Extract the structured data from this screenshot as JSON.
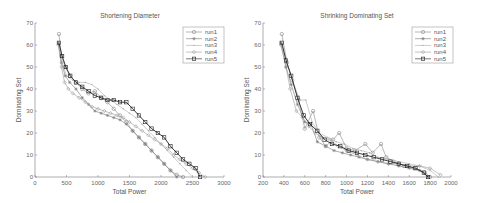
{
  "chart_data": [
    {
      "type": "line",
      "title": "Shortening Diameter",
      "xlabel": "Total Power",
      "ylabel": "Dominating Set",
      "xlim": [
        0,
        3000
      ],
      "ylim": [
        0,
        70
      ],
      "xticks": [
        0,
        500,
        1000,
        1500,
        2000,
        2500,
        3000
      ],
      "yticks": [
        0,
        10,
        20,
        30,
        40,
        50,
        60,
        70
      ],
      "legend_position": "upper right",
      "grid": false,
      "series": [
        {
          "name": "run1",
          "marker": "circle",
          "color": "#888888",
          "x": [
            380,
            420,
            480,
            550,
            650,
            750,
            850,
            950,
            1050,
            1150,
            1250,
            1350,
            1450,
            1550,
            1650,
            1750,
            1850,
            1950,
            2050,
            2150,
            2250,
            2350
          ],
          "y": [
            65,
            55,
            50,
            46,
            43,
            40,
            38,
            39,
            36,
            34,
            31,
            28,
            25,
            21,
            18,
            15,
            12,
            9,
            6,
            3,
            1,
            0
          ]
        },
        {
          "name": "run2",
          "marker": "star",
          "color": "#777777",
          "x": [
            370,
            420,
            480,
            550,
            650,
            750,
            850,
            950,
            1050,
            1150,
            1250,
            1350,
            1450,
            1550,
            1650,
            1750,
            1850,
            1950,
            2050,
            2150,
            2250
          ],
          "y": [
            61,
            52,
            46,
            43,
            40,
            36,
            33,
            30,
            29,
            28,
            27,
            26,
            24,
            21,
            18,
            15,
            12,
            9,
            6,
            3,
            0
          ]
        },
        {
          "name": "run3",
          "marker": "point",
          "color": "#aaaaaa",
          "x": [
            370,
            430,
            500,
            600,
            700,
            800,
            900,
            1000,
            1100,
            1200,
            1300,
            1400,
            1500,
            1600,
            1700,
            1800,
            1900,
            2000,
            2100,
            2200,
            2300,
            2400,
            2500
          ],
          "y": [
            61,
            52,
            46,
            44,
            43,
            43,
            42,
            40,
            37,
            35,
            33,
            31,
            29,
            27,
            24,
            21,
            18,
            15,
            12,
            9,
            6,
            3,
            0
          ]
        },
        {
          "name": "run4",
          "marker": "diamond",
          "color": "#999999",
          "x": [
            370,
            420,
            470,
            530,
            600,
            700,
            800,
            900,
            1000,
            1100,
            1200,
            1300,
            1400,
            1500,
            1600,
            1700,
            1800,
            1900,
            2000,
            2100,
            2200,
            2300,
            2400,
            2500,
            2600,
            2700
          ],
          "y": [
            60,
            50,
            43,
            40,
            38,
            36,
            34,
            32,
            31,
            30,
            29,
            28,
            27,
            25,
            23,
            21,
            19,
            17,
            15,
            13,
            10,
            8,
            6,
            4,
            2,
            0
          ]
        },
        {
          "name": "run5",
          "marker": "square",
          "color": "#222222",
          "x": [
            380,
            430,
            490,
            560,
            650,
            750,
            850,
            950,
            1050,
            1150,
            1250,
            1350,
            1450,
            1550,
            1650,
            1750,
            1850,
            1950,
            2050,
            2150,
            2250,
            2350,
            2450,
            2550,
            2620
          ],
          "y": [
            61,
            55,
            50,
            46,
            43,
            41,
            39,
            37,
            36,
            35,
            35,
            34,
            34,
            31,
            28,
            25,
            22,
            20,
            18,
            14,
            11,
            8,
            6,
            4,
            0
          ]
        }
      ]
    },
    {
      "type": "line",
      "title": "Shrinking Dominating Set",
      "xlabel": "Total Power",
      "ylabel": "Dominating Set",
      "xlim": [
        200,
        2000
      ],
      "ylim": [
        0,
        70
      ],
      "xticks": [
        200,
        400,
        600,
        800,
        1000,
        1200,
        1400,
        1600,
        1800,
        2000
      ],
      "yticks": [
        0,
        10,
        20,
        30,
        40,
        50,
        60,
        70
      ],
      "legend_position": "upper right",
      "grid": false,
      "series": [
        {
          "name": "run1",
          "marker": "circle",
          "color": "#888888",
          "x": [
            380,
            430,
            480,
            540,
            600,
            680,
            740,
            800,
            870,
            930,
            1000,
            1080,
            1180,
            1250,
            1330,
            1380,
            1450,
            1550,
            1650,
            1750,
            1800
          ],
          "y": [
            65,
            52,
            44,
            35,
            22,
            30,
            18,
            14,
            17,
            20,
            13,
            12,
            15,
            11,
            15,
            9,
            7,
            5,
            4,
            2,
            0
          ]
        },
        {
          "name": "run2",
          "marker": "star",
          "color": "#777777",
          "x": [
            370,
            420,
            470,
            530,
            600,
            660,
            720,
            800,
            880,
            960,
            1040,
            1120,
            1200,
            1300,
            1400,
            1500,
            1600,
            1700,
            1780
          ],
          "y": [
            61,
            50,
            42,
            33,
            25,
            24,
            16,
            14,
            12,
            11,
            10,
            9,
            8,
            7,
            6,
            5,
            4,
            3,
            0
          ]
        },
        {
          "name": "run3",
          "marker": "point",
          "color": "#aaaaaa",
          "x": [
            380,
            430,
            490,
            550,
            610,
            670,
            740,
            820,
            900,
            980,
            1060,
            1140,
            1220,
            1300,
            1400,
            1500,
            1600,
            1700,
            1800,
            1880
          ],
          "y": [
            60,
            52,
            43,
            35,
            35,
            25,
            20,
            18,
            16,
            15,
            13,
            12,
            11,
            9,
            8,
            7,
            6,
            5,
            3,
            0
          ]
        },
        {
          "name": "run4",
          "marker": "diamond",
          "color": "#999999",
          "x": [
            370,
            420,
            460,
            520,
            580,
            640,
            700,
            760,
            840,
            920,
            1000,
            1100,
            1200,
            1300,
            1400,
            1500,
            1600,
            1700,
            1800,
            1900
          ],
          "y": [
            60,
            50,
            40,
            30,
            27,
            23,
            20,
            18,
            17,
            14,
            12,
            10,
            8,
            7,
            6,
            6,
            5,
            5,
            4,
            1
          ]
        },
        {
          "name": "run5",
          "marker": "square",
          "color": "#222222",
          "x": [
            380,
            420,
            470,
            530,
            590,
            650,
            720,
            790,
            860,
            940,
            1020,
            1100,
            1180,
            1260,
            1340,
            1420,
            1500,
            1580,
            1660,
            1740,
            1780
          ],
          "y": [
            61,
            53,
            46,
            36,
            28,
            24,
            21,
            17,
            15,
            14,
            12,
            11,
            10,
            9,
            8,
            7,
            6,
            5,
            4,
            2,
            0
          ]
        }
      ]
    }
  ]
}
